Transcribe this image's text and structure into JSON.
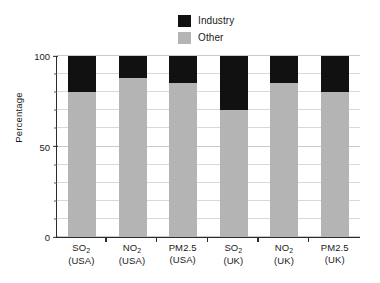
{
  "chart_data": {
    "type": "bar",
    "subtype": "stacked-bar-100-percent",
    "title": "",
    "xlabel": "",
    "ylabel": "Percentage",
    "ylim": [
      0,
      100
    ],
    "yticks": [
      0,
      50,
      100
    ],
    "ytick_labels": [
      "0",
      "50",
      "100"
    ],
    "minor_tick_interval": 10,
    "grid": true,
    "grid_axis": "y",
    "legend_position": "top-center",
    "categories": [
      "SO₂ (USA)",
      "NO₂ (USA)",
      "PM2.5 (USA)",
      "SO₂ (UK)",
      "NO₂ (UK)",
      "PM2.5 (UK)"
    ],
    "category_lines": [
      {
        "line1": "SO",
        "sub1": "2",
        "line2": "(USA)"
      },
      {
        "line1": "NO",
        "sub1": "2",
        "line2": "(USA)"
      },
      {
        "line1": "PM2.5",
        "sub1": "",
        "line2": "(USA)"
      },
      {
        "line1": "SO",
        "sub1": "2",
        "line2": "(UK)"
      },
      {
        "line1": "NO",
        "sub1": "2",
        "line2": "(UK)"
      },
      {
        "line1": "PM2.5",
        "sub1": "",
        "line2": "(UK)"
      }
    ],
    "series": [
      {
        "name": "Other",
        "color": "#b4b4b4",
        "values": [
          80,
          88,
          85,
          70,
          85,
          80
        ]
      },
      {
        "name": "Industry",
        "color": "#111111",
        "values": [
          20,
          12,
          15,
          30,
          15,
          20
        ]
      }
    ]
  },
  "legend": {
    "items": [
      {
        "label": "Industry",
        "color": "#111111"
      },
      {
        "label": "Other",
        "color": "#b4b4b4"
      }
    ]
  },
  "axis": {
    "y_title": "Percentage",
    "y_tick_labels": [
      "100",
      "50",
      "0"
    ]
  },
  "colors": {
    "industry": "#111111",
    "other": "#b4b4b4",
    "axis": "#2b2b2b",
    "grid": "#d8d8d8",
    "background": "#ffffff"
  }
}
